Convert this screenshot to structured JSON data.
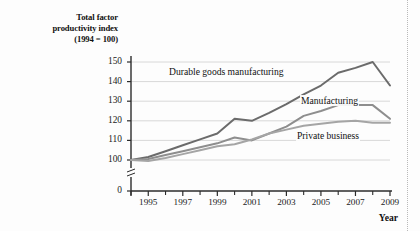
{
  "chart_data": {
    "type": "line",
    "title": "",
    "ylabel": "Total factor productivity index (1994 = 100)",
    "ylabel_lines": [
      "Total factor",
      "productivity index",
      "(1994 = 100)"
    ],
    "xlabel": "Year",
    "x": [
      1994,
      1995,
      1996,
      1997,
      1998,
      1999,
      2000,
      2001,
      2002,
      2003,
      2004,
      2005,
      2006,
      2007,
      2008,
      2009
    ],
    "xtick_labels": [
      "1995",
      "1997",
      "1999",
      "2001",
      "2003",
      "2005",
      "2007",
      "2009"
    ],
    "xtick_values": [
      1995,
      1997,
      1999,
      2001,
      2003,
      2005,
      2007,
      2009
    ],
    "xminor_values": [
      1994,
      1996,
      1998,
      2000,
      2002,
      2004,
      2006,
      2008
    ],
    "ytick_labels": [
      "0",
      "100",
      "110",
      "120",
      "130",
      "140",
      "150"
    ],
    "ytick_values": [
      0,
      100,
      110,
      120,
      130,
      140,
      150
    ],
    "ylim": [
      100,
      150
    ],
    "axis_break": true,
    "grid": "horizontal",
    "legend_position": "inline-annotation",
    "series": [
      {
        "name": "Durable goods manufacturing",
        "color": "#6b6b6b",
        "values": [
          100.0,
          101.5,
          104.5,
          107.5,
          110.5,
          113.5,
          121.0,
          120.0,
          124.0,
          128.5,
          133.5,
          138.0,
          144.5,
          147.0,
          150.0,
          138.0
        ]
      },
      {
        "name": "Manufacturing",
        "color": "#8e8e8e",
        "values": [
          100.0,
          100.5,
          102.5,
          104.5,
          106.5,
          108.5,
          111.5,
          110.0,
          113.5,
          117.0,
          122.5,
          125.0,
          128.0,
          128.0,
          128.0,
          121.0
        ]
      },
      {
        "name": "Private business",
        "color": "#a5a5a5",
        "values": [
          100.0,
          99.5,
          101.0,
          103.0,
          105.0,
          107.0,
          108.0,
          110.5,
          113.5,
          115.5,
          117.5,
          118.5,
          119.5,
          120.0,
          119.0,
          119.0
        ]
      }
    ],
    "annotations": [
      {
        "text": "Durable goods manufacturing",
        "x_px": 168,
        "y_px": 66
      },
      {
        "text": "Manufacturing",
        "x_px": 300,
        "y_px": 95
      },
      {
        "text": "Private business",
        "x_px": 296,
        "y_px": 130
      }
    ]
  }
}
